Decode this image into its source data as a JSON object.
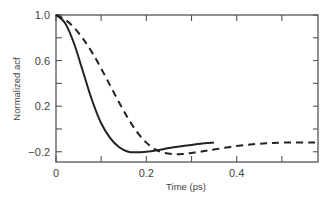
{
  "chart_data": {
    "type": "line",
    "title": "",
    "xlabel": "Time (ps)",
    "ylabel": "Normalized acf",
    "xlim": [
      0,
      0.58
    ],
    "ylim": [
      -0.29,
      1.0
    ],
    "x_ticks": [
      0,
      0.1,
      0.2,
      0.3,
      0.4,
      0.5
    ],
    "x_tick_labels": [
      "0",
      "",
      "0.2",
      "",
      "0.4",
      ""
    ],
    "y_ticks": [
      1.0,
      0.8,
      0.6,
      0.4,
      0.2,
      0.0,
      -0.2
    ],
    "y_tick_labels": [
      "1.0",
      "",
      "0.6",
      "",
      "0.2",
      "",
      "-0.2"
    ],
    "grid": false,
    "legend": null,
    "series": [
      {
        "name": "solid",
        "style": "solid",
        "x": [
          0,
          0.02,
          0.04,
          0.06,
          0.08,
          0.1,
          0.12,
          0.14,
          0.16,
          0.18,
          0.2,
          0.22,
          0.24,
          0.26,
          0.28,
          0.3,
          0.32,
          0.35
        ],
        "y": [
          1.0,
          0.93,
          0.75,
          0.5,
          0.25,
          0.05,
          -0.08,
          -0.16,
          -0.2,
          -0.205,
          -0.2,
          -0.19,
          -0.175,
          -0.16,
          -0.15,
          -0.14,
          -0.13,
          -0.12
        ]
      },
      {
        "name": "dashed",
        "style": "dashed",
        "x": [
          0,
          0.02,
          0.04,
          0.06,
          0.08,
          0.1,
          0.12,
          0.14,
          0.16,
          0.18,
          0.2,
          0.22,
          0.24,
          0.26,
          0.28,
          0.3,
          0.32,
          0.35,
          0.4,
          0.45,
          0.5,
          0.58
        ],
        "y": [
          1.0,
          0.96,
          0.89,
          0.79,
          0.67,
          0.53,
          0.38,
          0.23,
          0.09,
          -0.03,
          -0.12,
          -0.18,
          -0.21,
          -0.22,
          -0.22,
          -0.21,
          -0.2,
          -0.18,
          -0.15,
          -0.13,
          -0.12,
          -0.12
        ]
      }
    ]
  }
}
